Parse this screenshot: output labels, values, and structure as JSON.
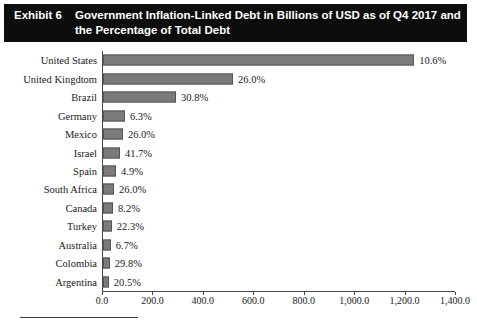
{
  "exhibit": {
    "label": "Exhibit 6",
    "title": "Government Inflation-Linked Debt in Billions of USD as of Q4 2017 and the Percentage of Total Debt"
  },
  "chart_data": {
    "type": "bar",
    "orientation": "horizontal",
    "title": "Government Inflation-Linked Debt in Billions of USD as of Q4 2017 and the Percentage of Total Debt",
    "xlabel": "",
    "ylabel": "",
    "xlim": [
      0,
      1400
    ],
    "grid": false,
    "legend": null,
    "categories": [
      "United States",
      "United Kingdtom",
      "Brazil",
      "Germany",
      "Mexico",
      "Israel",
      "Spain",
      "South Africa",
      "Canada",
      "Turkey",
      "Australia",
      "Colombia",
      "Argentina"
    ],
    "values": [
      1234.0,
      516.0,
      290.0,
      87.0,
      79.0,
      67.0,
      52.0,
      44.0,
      40.0,
      35.0,
      31.0,
      27.0,
      23.0
    ],
    "data_labels": [
      "10.6%",
      "26.0%",
      "30.8%",
      "6.3%",
      "26.0%",
      "41.7%",
      "4.9%",
      "26.0%",
      "8.2%",
      "22.3%",
      "6.7%",
      "29.8%",
      "20.5%"
    ],
    "xticks": [
      0,
      200,
      400,
      600,
      800,
      1000,
      1200,
      1400
    ],
    "xtick_labels": [
      "0.0",
      "200.0",
      "400.0",
      "600.0",
      "800.0",
      "1,000.0",
      "1,200.0",
      "1,400.0"
    ],
    "bar_color": "#7b7b7b",
    "bar_border_color": "#555555",
    "axis_color": "#4a4a4a",
    "header_background": "#0d0d0d",
    "header_text_color": "#ffffff"
  }
}
